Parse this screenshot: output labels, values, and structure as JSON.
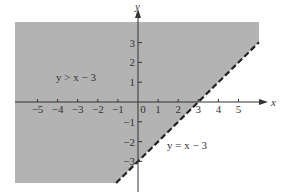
{
  "chart_data": {
    "type": "area",
    "title": "",
    "xlabel": "x",
    "ylabel": "y",
    "xlim": [
      -6,
      6
    ],
    "ylim": [
      -4,
      4
    ],
    "grid": false,
    "x_ticks": [
      -5,
      -4,
      -3,
      -2,
      -1,
      0,
      1,
      2,
      3,
      4,
      5
    ],
    "x_tick_labels": [
      "−5",
      "−4",
      "−3",
      "−2",
      "−1",
      "0",
      "1",
      "2",
      "3",
      "4",
      "5"
    ],
    "y_ticks": [
      3,
      2,
      1,
      -1,
      -2,
      -3
    ],
    "y_tick_labels": [
      "3",
      "2",
      "1",
      "−1",
      "−2",
      "−3"
    ],
    "boundary_line": {
      "equation": "y = x - 3",
      "slope": 1,
      "intercept": -3,
      "style": "dashed",
      "points": [
        [
          -1.05,
          -4.05
        ],
        [
          6.0,
          3.0
        ]
      ]
    },
    "shaded_region": {
      "inequality": "y > x - 3",
      "side": "above-left of boundary",
      "color": "#b3b3b3"
    },
    "annotations": [
      {
        "text": "y > x − 3",
        "x": -4.2,
        "y": 1.3,
        "location": "shaded region"
      },
      {
        "text": "y = x − 3",
        "x": 3.0,
        "y": -2.2,
        "location": "near boundary line"
      }
    ]
  },
  "labels": {
    "x_axis": "x",
    "y_axis": "y",
    "region_label": "y > x − 3",
    "line_label": "y = x − 3"
  },
  "colors": {
    "shade": "#b3b3b3",
    "axis": "#333333",
    "line": "#222222",
    "background": "#ffffff"
  }
}
